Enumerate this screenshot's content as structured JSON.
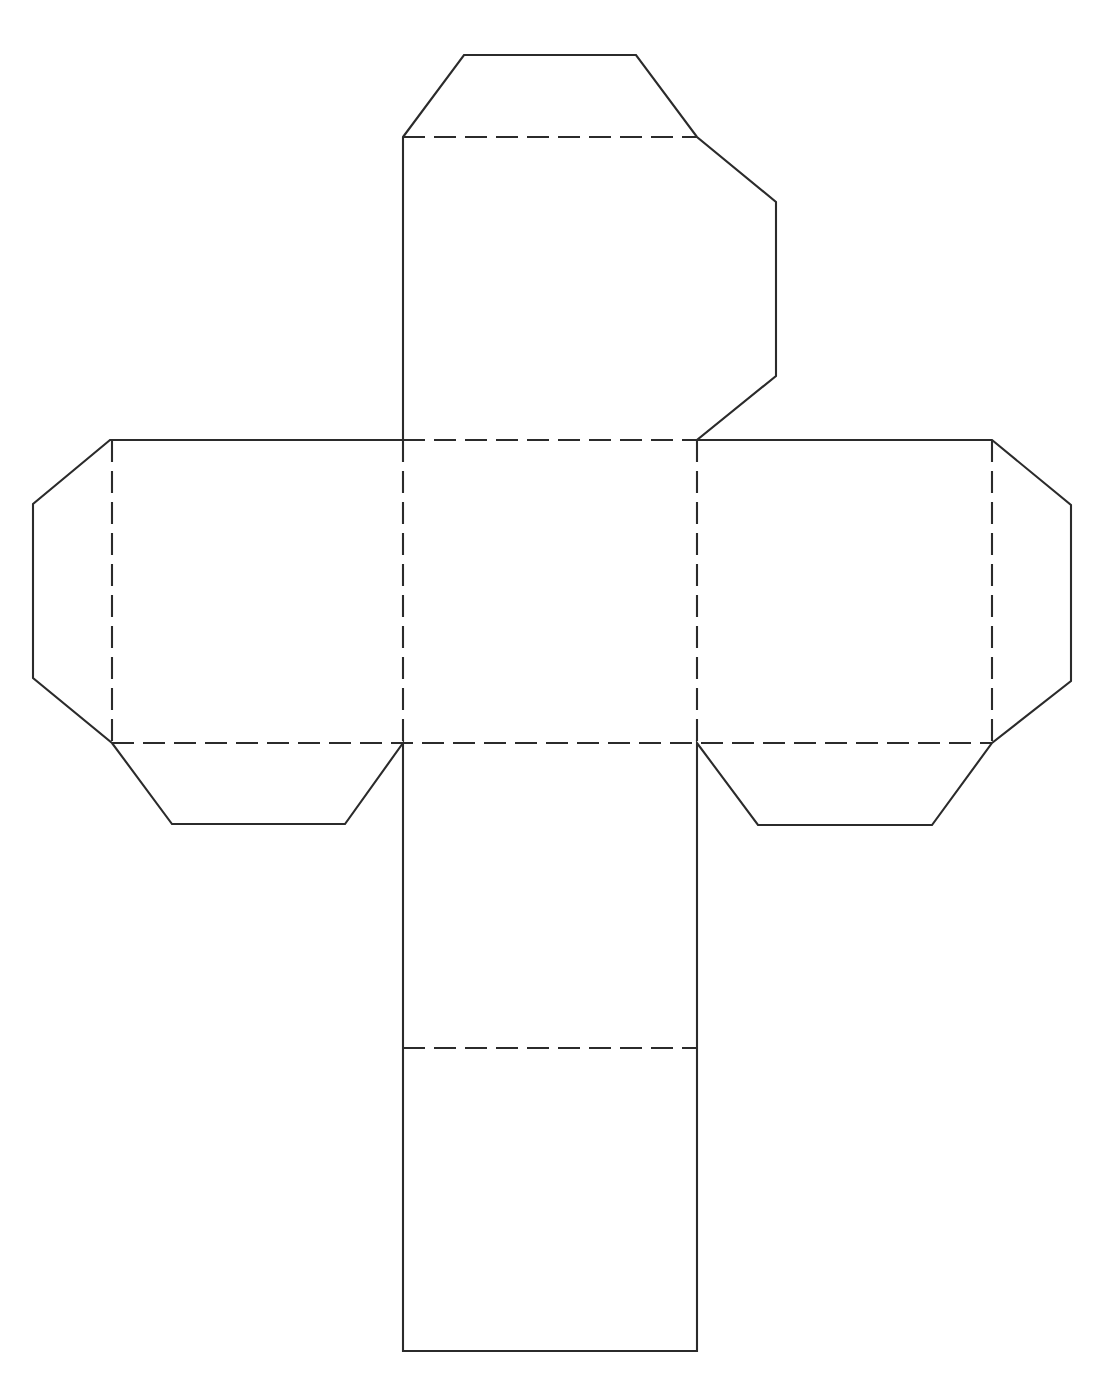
{
  "document": {
    "title": "Cube Net Template",
    "description": "Black and white line drawing of an unfolded cube (hexahedron) net papercraft template with glue tabs",
    "background_color": "#ffffff",
    "line_color": "#2b2b2b",
    "line_width_px": 2.1,
    "canvas": {
      "width": 1118,
      "height": 1376
    }
  },
  "legend": {
    "cut_line_label": "solid line = cut",
    "fold_line_label": "dashed line = fold"
  },
  "geometry": {
    "cut_style": {
      "stroke": "#2b2b2b",
      "width": 2.1,
      "dash": "none"
    },
    "fold_style": {
      "stroke": "#2b2b2b",
      "width": 2.1,
      "dash": "22 9"
    },
    "center_square": {
      "x1": 403,
      "y1": 440,
      "x2": 697,
      "y2": 743
    },
    "panels": [
      {
        "name": "top-panel",
        "x1": 403,
        "y1": 137,
        "x2": 697,
        "y2": 440
      },
      {
        "name": "left-panel",
        "x1": 112,
        "y1": 440,
        "x2": 403,
        "y2": 743
      },
      {
        "name": "center-panel",
        "x1": 403,
        "y1": 440,
        "x2": 697,
        "y2": 743
      },
      {
        "name": "right-panel",
        "x1": 697,
        "y1": 440,
        "x2": 992,
        "y2": 743
      },
      {
        "name": "bottom-panel",
        "x1": 403,
        "y1": 743,
        "x2": 697,
        "y2": 1048
      },
      {
        "name": "bottom-flap-panel",
        "x1": 403,
        "y1": 1048,
        "x2": 697,
        "y2": 1351
      }
    ],
    "paths": {
      "outline": "M 403,137 L 464,55 L 636,55 L 697,137 L 776,202 L 776,376 L 697,440 L 992,440 L 1071,505 L 1071,681 L 992,743 L 932,825 L 758,825 L 697,743 L 697,1351 L 403,1351 L 403,743 L 345,824 L 172,824 L 112,743 L 33,678 L 33,504 L 110,440 L 403,440 L 403,137 Z",
      "fold_top_edge": "M 403,137 L 697,137",
      "fold_upper_horizontal": "M 403,440 L 697,440",
      "fold_lower_horizontal": "M 112,743 L 992,743",
      "fold_left_vertical": "M 403,440 L 403,743",
      "fold_right_vertical": "M 697,440 L 697,743",
      "fold_left_panel_vertical": "M 112,440 L 112,743",
      "fold_right_panel_vertical": "M 992,440 L 992,743",
      "fold_bottom_horizontal": "M 403,1048 L 697,1048"
    }
  },
  "elements": {
    "top_flap": {
      "name": "top-glue-flap",
      "points": "403,137 464,55 636,55 697,137"
    },
    "top_left_tab": {
      "name": "top-left-side-tab",
      "points": "403,137 326,202 326,377 403,440"
    },
    "top_right_tab": {
      "name": "top-right-side-tab",
      "points": "697,137 776,202 776,376 697,440"
    },
    "left_flap": {
      "name": "left-glue-flap",
      "points": "110,440 33,504 33,678 112,743"
    },
    "left_bottom_tab": {
      "name": "left-bottom-tab",
      "points": "112,743 172,824 345,824 403,743"
    },
    "right_flap": {
      "name": "right-glue-flap",
      "points": "992,440 1071,505 1071,681 992,743"
    },
    "right_bottom_tab": {
      "name": "right-bottom-tab",
      "points": "697,743 758,825 932,825 992,743"
    },
    "bottom_strip": {
      "name": "bottom-panel-strip",
      "points": "403,743 697,743 697,1351 403,1351"
    }
  }
}
